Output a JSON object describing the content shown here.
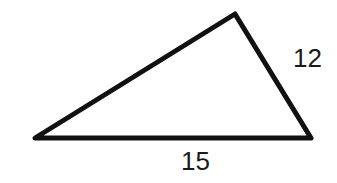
{
  "diagram": {
    "type": "triangle",
    "stroke_color": "#111111",
    "vertices": {
      "left": [
        35,
        138
      ],
      "top": [
        235,
        14
      ],
      "right": [
        311,
        138
      ]
    },
    "labels": {
      "right_side": "12",
      "base": "15"
    }
  }
}
